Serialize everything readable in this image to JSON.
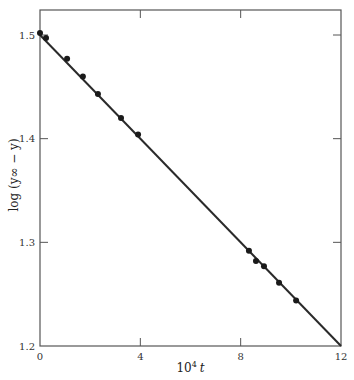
{
  "chart_data": {
    "type": "scatter",
    "title": "",
    "xlabel": "10⁴ t",
    "xlabel_parts": {
      "base": "10",
      "sup": "4",
      "var": "t"
    },
    "ylabel": "log (y∞ − y)",
    "xlim": [
      0,
      12
    ],
    "ylim": [
      1.2,
      1.5
    ],
    "x_ticks": [
      0,
      4,
      8,
      12
    ],
    "y_ticks": [
      1.2,
      1.3,
      1.4,
      1.5
    ],
    "x_tick_labels": [
      "0",
      "4",
      "8",
      "12"
    ],
    "y_tick_labels": [
      "1.2",
      "1.3",
      "1.4",
      "1.5"
    ],
    "grid": false,
    "legend": null,
    "series": [
      {
        "name": "measurements",
        "marker": "filled-circle",
        "x": [
          0.0,
          0.24,
          1.08,
          1.71,
          2.31,
          3.23,
          3.91,
          8.33,
          8.61,
          8.93,
          9.53,
          10.21
        ],
        "y": [
          1.502,
          1.497,
          1.477,
          1.46,
          1.443,
          1.42,
          1.404,
          1.292,
          1.282,
          1.277,
          1.261,
          1.244
        ]
      }
    ],
    "fit_line": {
      "name": "linear fit",
      "x": [
        0,
        12
      ],
      "y": [
        1.5,
        1.2
      ]
    },
    "colors": {
      "line": "#2a2a2a",
      "points": "#1a1a1a",
      "frame": "#555555"
    }
  }
}
